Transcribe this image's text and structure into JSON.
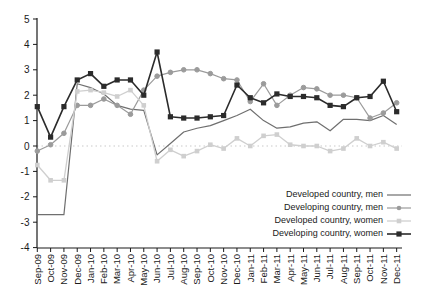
{
  "figure": {
    "background": "#ffffff"
  },
  "chart_data": {
    "type": "line",
    "title": "",
    "xlabel": "",
    "ylabel": "",
    "ylim": [
      -4,
      5
    ],
    "yticks": [
      5,
      4,
      3,
      2,
      1,
      0,
      -1,
      -2,
      -3,
      -4
    ],
    "grid": "zero-line-only",
    "zero_line_style": "dotted",
    "legend_position": "inside-bottom-right",
    "colors": {
      "axis": "#1a1a1a",
      "tick_label": "#1a1a1a",
      "zero_line": "#c9c9c9"
    },
    "x_categories": [
      "Sep-09",
      "Oct-09",
      "Nov-09",
      "Dec-09",
      "Jan-10",
      "Feb-10",
      "Mar-10",
      "Apr-10",
      "May-10",
      "Jun-10",
      "Jul-10",
      "Aug-10",
      "Sep-10",
      "Oct-10",
      "Nov-10",
      "Dec-10",
      "Jan-11",
      "Feb-11",
      "Mar-11",
      "Apr-11",
      "May-11",
      "Jun-11",
      "Jul-11",
      "Aug-11",
      "Sep-11",
      "Oct-11",
      "Nov-11",
      "Dec-11"
    ],
    "series": [
      {
        "id": "developed-country-men",
        "name": "Developed country, men",
        "marker": "none",
        "marker_size": 0,
        "line_width": 1.2,
        "color": "#6f6f6f",
        "values": [
          -2.7,
          -2.7,
          -2.7,
          2.45,
          2.3,
          2.05,
          1.6,
          1.45,
          1.4,
          -0.35,
          0.1,
          0.55,
          0.7,
          0.8,
          1.0,
          1.2,
          1.45,
          1.0,
          0.7,
          0.75,
          0.9,
          0.95,
          0.6,
          1.05,
          1.05,
          1.0,
          1.2,
          0.85
        ]
      },
      {
        "id": "developing-country-men",
        "name": "Developing country, men",
        "marker": "circle",
        "marker_size": 4.6,
        "line_width": 1.2,
        "color": "#9b9b9b",
        "values": [
          -0.2,
          0.05,
          0.5,
          1.6,
          1.6,
          1.85,
          1.6,
          1.25,
          2.2,
          2.75,
          2.9,
          3.0,
          3.0,
          2.85,
          2.65,
          2.6,
          1.75,
          2.45,
          1.6,
          2.0,
          2.3,
          2.25,
          2.0,
          2.0,
          1.9,
          1.1,
          1.3,
          1.7
        ]
      },
      {
        "id": "developed-country-women",
        "name": "Developed country, women",
        "marker": "square",
        "marker_size": 4.6,
        "line_width": 1.3,
        "color": "#cfcfcf",
        "values": [
          -0.75,
          -1.35,
          -1.35,
          2.15,
          2.2,
          2.1,
          1.95,
          2.2,
          1.6,
          -0.6,
          -0.15,
          -0.4,
          -0.2,
          0.05,
          -0.1,
          0.3,
          0.0,
          0.4,
          0.45,
          0.05,
          0.0,
          0.0,
          -0.2,
          -0.1,
          0.3,
          0.0,
          0.15,
          -0.1
        ]
      },
      {
        "id": "developing-country-women",
        "name": "Developing country, women",
        "marker": "square",
        "marker_size": 5.2,
        "line_width": 1.6,
        "color": "#2b2b2b",
        "values": [
          1.55,
          0.35,
          1.55,
          2.6,
          2.85,
          2.35,
          2.6,
          2.6,
          2.0,
          3.7,
          1.15,
          1.1,
          1.1,
          1.15,
          1.2,
          2.4,
          1.9,
          1.7,
          2.05,
          1.95,
          1.95,
          1.9,
          1.6,
          1.55,
          1.9,
          1.95,
          2.55,
          1.35
        ]
      }
    ]
  }
}
